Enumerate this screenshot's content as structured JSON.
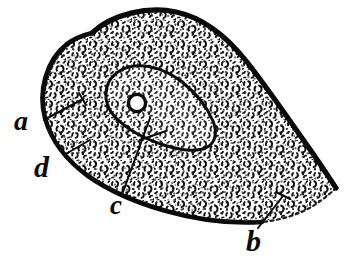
{
  "figure": {
    "kind": "scientific-illustration",
    "background_color": "#ffffff",
    "ink_color": "#0a0a0a",
    "width": 344,
    "height": 268
  },
  "labels": [
    {
      "id": "a",
      "text": "a",
      "target": "cytoplasm-granules"
    },
    {
      "id": "b",
      "text": "b",
      "target": "tapered-tail-tip"
    },
    {
      "id": "c",
      "text": "c",
      "target": "nucleus-boundary"
    },
    {
      "id": "d",
      "text": "d",
      "target": "cell-membrane-edge"
    }
  ],
  "structures": {
    "cell_body": "outer-cell-outline",
    "nucleus": "nucleus-outline",
    "nucleolus": "nucleolus-ring",
    "cytoplasm": "granular-cytoplasm-texture"
  }
}
